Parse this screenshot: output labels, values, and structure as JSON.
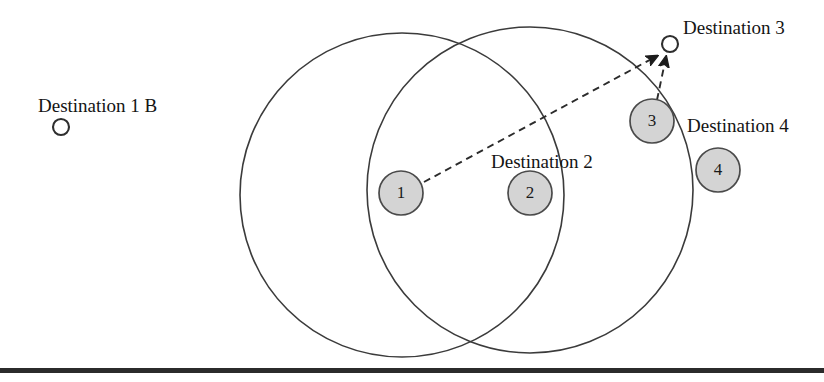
{
  "figure": {
    "width": 824,
    "height": 382,
    "background": "#ffffff"
  },
  "colors": {
    "agent_fill": "#d4d4d4",
    "agent_stroke": "#4a4a4a",
    "coverage_stroke": "#3b3b3b",
    "dash_stroke": "#2b2b2b",
    "marker_fill": "#ffffff",
    "marker_stroke": "#2e2e2e",
    "baseline": "#2b2b2b",
    "text": "#141414"
  },
  "labels": {
    "destination_1b": "Destination 1 B",
    "destination_2": "Destination 2",
    "destination_3": "Destination 3",
    "destination_4": "Destination 4"
  },
  "agents": [
    {
      "id": "1",
      "label": "1",
      "cx": 401,
      "cy": 193,
      "r": 22
    },
    {
      "id": "2",
      "label": "2",
      "cx": 530,
      "cy": 193,
      "r": 22
    },
    {
      "id": "3",
      "label": "3",
      "cx": 652,
      "cy": 121,
      "r": 22
    },
    {
      "id": "4",
      "label": "4",
      "cx": 718,
      "cy": 170,
      "r": 22
    }
  ],
  "destination_markers": [
    {
      "id": "dest-1b",
      "label": "Destination 1 B",
      "cx": 61,
      "cy": 127,
      "r": 8
    },
    {
      "id": "dest-3",
      "label": "Destination 3",
      "cx": 670,
      "cy": 44,
      "r": 8
    }
  ],
  "coverage_circles": [
    {
      "id": "coverage-left",
      "cx": 402,
      "cy": 195,
      "r": 162
    },
    {
      "id": "coverage-right",
      "cx": 530,
      "cy": 190,
      "r": 163
    }
  ],
  "arrows": [
    {
      "id": "arrow-agent1-to-dest3",
      "from": "agent-1",
      "to": "dest-3",
      "x1": 424,
      "y1": 182,
      "x2": 659,
      "y2": 55,
      "style": "dashed"
    },
    {
      "id": "arrow-agent3-to-dest3",
      "from": "agent-3",
      "to": "dest-3",
      "x1": 659,
      "y1": 99,
      "x2": 667,
      "y2": 56,
      "style": "dashed"
    }
  ],
  "label_positions": {
    "destination_1b": {
      "x": 38,
      "y": 112
    },
    "destination_2": {
      "x": 491,
      "y": 168
    },
    "destination_3": {
      "x": 683,
      "y": 34
    },
    "destination_4": {
      "x": 687,
      "y": 132
    }
  },
  "baseline": {
    "x": 0,
    "y": 368,
    "width": 824,
    "height": 5
  }
}
